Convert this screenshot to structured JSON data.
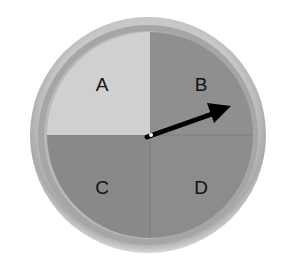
{
  "spinner": {
    "sections": [
      {
        "label": "A",
        "color": "#d0d0d0",
        "position": "top-left"
      },
      {
        "label": "B",
        "color": "#8e8e8e",
        "position": "top-right"
      },
      {
        "label": "C",
        "color": "#8a8a8a",
        "position": "bottom-left"
      },
      {
        "label": "D",
        "color": "#8c8c8c",
        "position": "bottom-right"
      }
    ],
    "rim_color": "#b4b4b4",
    "arrow_color": "#000000",
    "arrow_points_to": "B"
  }
}
